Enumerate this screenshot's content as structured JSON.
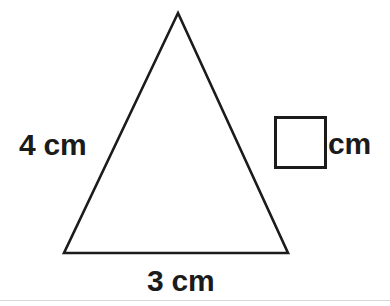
{
  "figure": {
    "type": "triangle-with-labeled-sides",
    "shape_name": "triangle",
    "stroke_color": "#1b1b1b",
    "background_color": "#ffffff",
    "vertices": {
      "apex": [
        178,
        13
      ],
      "bottom_left": [
        64,
        253
      ],
      "bottom_right": [
        288,
        253
      ]
    },
    "polygon_points": "178,13 288,253 64,253"
  },
  "labels": {
    "left_side": "4 cm",
    "bottom_side": "3 cm",
    "answer_unit": "cm"
  },
  "answer_box": {
    "value": "",
    "placeholder": ""
  }
}
